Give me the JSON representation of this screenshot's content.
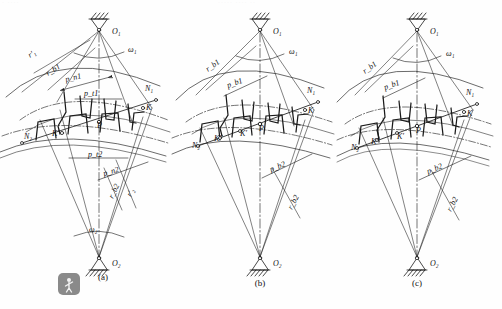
{
  "figure": {
    "background_color": "#fefefe",
    "ink_color": "#1a1a1a",
    "ghost_header_left": "· ····",
    "ghost_header_mid": "····· ···· ··",
    "panels": [
      {
        "id": "a",
        "caption": "(a)",
        "labels": {
          "center_top": "O₁",
          "center_bottom": "O₂",
          "omega_top": "ω₁",
          "omega_bottom": "ω₂",
          "r_prime_1": "r′₁",
          "r_base_1": "r_b1",
          "r_prime_2": "r′₂",
          "r_base_2": "r_b2",
          "pitch_normal_1": "p_n1",
          "pitch_trans_1": "p_t1",
          "pitch_trans_2": "p_t2",
          "pitch_normal_2": "p_n2",
          "point_N1": "N₁",
          "point_N2": "N₂",
          "point_K": "K",
          "point_K_prime": "K′",
          "point_P": "P"
        }
      },
      {
        "id": "b",
        "caption": "(b)",
        "labels": {
          "center_top": "O₁",
          "center_bottom": "O₂",
          "omega_top": "ω₁",
          "r_base_1": "r_b1",
          "r_base_2": "r_b2",
          "pitch_base_1": "p_b1",
          "pitch_base_2": "p_b2",
          "point_N1": "N₁",
          "point_N2": "N₂",
          "point_K": "K",
          "point_K_prime": "K′",
          "point_K_dprime": "K″",
          "point_P": "P"
        }
      },
      {
        "id": "c",
        "caption": "(c)",
        "labels": {
          "center_top": "O₁",
          "center_bottom": "O₂",
          "omega_top": "ω₁",
          "r_base_1": "r_b1",
          "r_base_2": "r_b2",
          "pitch_base_1": "p_b1",
          "pitch_base_2": "p_b2",
          "point_N1": "N₁",
          "point_N2": "N₂",
          "point_K": "K",
          "point_K_prime": "K′",
          "point_K_dprime": "K″",
          "point_P": "P"
        }
      }
    ],
    "watermark": {
      "shape": "rounded-square",
      "color": "#8a8a8a",
      "glyph": "stylized-figure"
    }
  }
}
